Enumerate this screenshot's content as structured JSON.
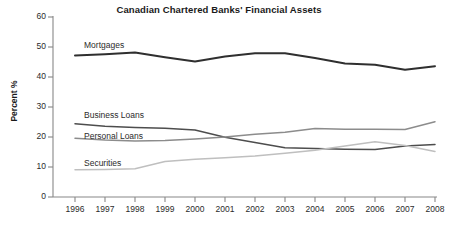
{
  "chart_data": {
    "type": "line",
    "title": "Canadian Chartered Banks' Financial Assets",
    "xlabel": "",
    "ylabel": "Percent %",
    "x": [
      1996,
      1997,
      1998,
      1999,
      2000,
      2001,
      2002,
      2003,
      2004,
      2005,
      2006,
      2007,
      2008
    ],
    "categories": [
      "1996",
      "1997",
      "1998",
      "1999",
      "2000",
      "2001",
      "2002",
      "2003",
      "2004",
      "2005",
      "2006",
      "2007",
      "2008"
    ],
    "xlim": [
      1996,
      2008
    ],
    "ylim": [
      0,
      60
    ],
    "yticks": [
      0,
      10,
      20,
      30,
      40,
      50,
      60
    ],
    "ytick_labels": [
      "0",
      "10",
      "20",
      "30",
      "40",
      "50",
      "60"
    ],
    "grid": false,
    "legend": "inline-labels",
    "series": [
      {
        "name": "Mortgages",
        "color": "#2f2f2f",
        "values": [
          47.2,
          47.6,
          48.2,
          46.6,
          45.2,
          46.8,
          47.9,
          47.9,
          46.3,
          44.5,
          44.1,
          42.4,
          43.6
        ]
      },
      {
        "name": "Business Loans",
        "color": "#4d4d4d",
        "values": [
          24.4,
          23.6,
          23.2,
          22.9,
          22.3,
          19.9,
          18.2,
          16.4,
          16.2,
          15.9,
          15.8,
          17.0,
          17.5
        ]
      },
      {
        "name": "Personal Loans",
        "color": "#8c8c8c",
        "values": [
          19.6,
          19.0,
          18.7,
          18.8,
          19.3,
          20.0,
          20.9,
          21.6,
          22.8,
          22.6,
          22.6,
          22.5,
          25.1
        ]
      },
      {
        "name": "Securities",
        "color": "#bfbfbf",
        "values": [
          9.1,
          9.2,
          9.4,
          11.8,
          12.6,
          13.1,
          13.7,
          14.6,
          15.6,
          17.0,
          18.4,
          17.2,
          15.2
        ]
      }
    ],
    "annotations": [
      {
        "text": "Mortgages",
        "series": "Mortgages"
      },
      {
        "text": "Business Loans",
        "series": "Business Loans"
      },
      {
        "text": "Personal Loans",
        "series": "Personal Loans"
      },
      {
        "text": "Securities",
        "series": "Securities"
      }
    ]
  },
  "axes": {
    "axis_color": "#888888"
  }
}
